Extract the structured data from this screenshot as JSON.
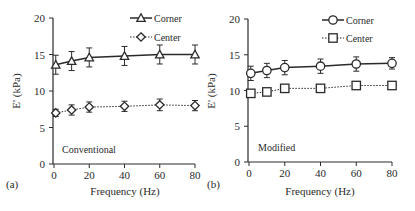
{
  "chart_data": [
    {
      "type": "line",
      "panel_label": "(a)",
      "annotation": "Conventional",
      "xlabel": "Frequency (Hz)",
      "ylabel": "E' (kPa)",
      "x": [
        1,
        10,
        20,
        40,
        60,
        80
      ],
      "xticks": [
        0,
        20,
        40,
        60,
        80
      ],
      "yticks": [
        0,
        5,
        10,
        15,
        20
      ],
      "xlim": [
        0,
        80
      ],
      "ylim": [
        0,
        20
      ],
      "grid": false,
      "legend_position": "upper right",
      "series": [
        {
          "name": "Corner",
          "marker": "triangle",
          "line": "solid",
          "values": [
            13.6,
            14.1,
            14.6,
            14.8,
            15.0,
            15.0
          ],
          "errors": [
            1.3,
            1.3,
            1.3,
            1.3,
            1.3,
            1.3
          ]
        },
        {
          "name": "Center",
          "marker": "diamond",
          "line": "dotted",
          "values": [
            7.0,
            7.4,
            7.8,
            7.9,
            8.1,
            8.0
          ],
          "errors": [
            0.5,
            0.7,
            0.7,
            0.7,
            0.8,
            0.7
          ]
        }
      ]
    },
    {
      "type": "line",
      "panel_label": "(b)",
      "annotation": "Modified",
      "xlabel": "Frequency (Hz)",
      "ylabel": "E' (kPa)",
      "x": [
        1,
        10,
        20,
        40,
        60,
        80
      ],
      "xticks": [
        0,
        20,
        40,
        60,
        80
      ],
      "yticks": [
        0,
        5,
        10,
        15,
        20
      ],
      "xlim": [
        0,
        80
      ],
      "ylim": [
        0,
        20
      ],
      "grid": false,
      "legend_position": "upper right",
      "series": [
        {
          "name": "Corner",
          "marker": "circle",
          "line": "solid",
          "values": [
            12.4,
            12.8,
            13.2,
            13.4,
            13.7,
            13.8
          ],
          "errors": [
            1.0,
            1.0,
            1.0,
            1.0,
            1.0,
            0.8
          ]
        },
        {
          "name": "Center",
          "marker": "square",
          "line": "dotted",
          "values": [
            9.6,
            9.8,
            10.3,
            10.3,
            10.7,
            10.7
          ],
          "errors": [
            0.5,
            0.3,
            0.3,
            0.3,
            0.3,
            0.3
          ]
        }
      ]
    }
  ],
  "colors": {
    "line": "#2a2a2a",
    "marker_fill": "#ffffff",
    "background": "#ffffff"
  }
}
